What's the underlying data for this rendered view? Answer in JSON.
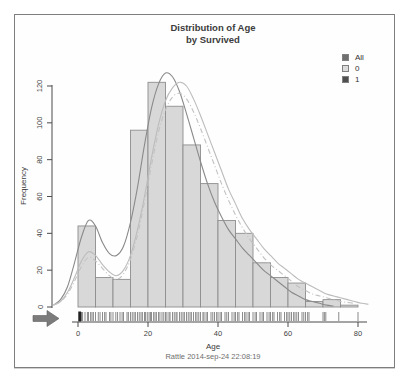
{
  "title": {
    "line1": "Distribution of Age",
    "line2": "by Survived"
  },
  "legend": {
    "items": [
      {
        "label": "All",
        "color": "#6f6f6f"
      },
      {
        "label": "0",
        "color": "#dcdcdc"
      },
      {
        "label": "1",
        "color": "#4f4f4f"
      }
    ]
  },
  "footer": "Rattle 2014-sep-24 22:08:19",
  "chart_data": {
    "type": "bar",
    "subtype": "histogram-with-density-and-rug",
    "title": "Distribution of Age by Survived",
    "xlabel": "Age",
    "ylabel": "Frequency",
    "xlim": [
      -7.5,
      84
    ],
    "ylim": [
      0,
      128
    ],
    "x_ticks": [
      0,
      20,
      40,
      60,
      80
    ],
    "y_ticks": [
      0,
      20,
      40,
      60,
      80,
      100,
      120
    ],
    "grid": "off",
    "legend_position": "top-right",
    "bin_width": 5,
    "bin_start_ages": [
      0,
      5,
      10,
      15,
      20,
      25,
      30,
      35,
      40,
      45,
      50,
      55,
      60,
      65,
      70,
      75
    ],
    "bin_counts": [
      44,
      16,
      15,
      96,
      122,
      109,
      88,
      67,
      47,
      40,
      24,
      16,
      13,
      3,
      4,
      1
    ],
    "bar_fill": "#d8d8d8",
    "bar_stroke": "#8e8e8e",
    "series": [
      {
        "name": "All",
        "style": "solid",
        "color": "#8a8a8a",
        "points": [
          [
            -7,
            1
          ],
          [
            -5,
            4
          ],
          [
            -3,
            11
          ],
          [
            -1,
            24
          ],
          [
            1,
            38
          ],
          [
            3,
            47
          ],
          [
            5,
            44
          ],
          [
            7,
            35
          ],
          [
            9,
            29
          ],
          [
            11,
            28
          ],
          [
            13,
            33
          ],
          [
            15,
            46
          ],
          [
            17,
            65
          ],
          [
            19,
            88
          ],
          [
            21,
            108
          ],
          [
            23,
            121
          ],
          [
            25,
            127
          ],
          [
            27,
            125
          ],
          [
            29,
            117
          ],
          [
            31,
            105
          ],
          [
            33,
            92
          ],
          [
            35,
            79
          ],
          [
            37,
            67
          ],
          [
            39,
            57
          ],
          [
            41,
            49
          ],
          [
            43,
            42
          ],
          [
            45,
            37
          ],
          [
            47,
            32
          ],
          [
            49,
            28
          ],
          [
            51,
            24
          ],
          [
            53,
            20
          ],
          [
            55,
            17
          ],
          [
            57,
            14
          ],
          [
            59,
            11
          ],
          [
            61,
            8
          ],
          [
            63,
            6
          ],
          [
            65,
            4
          ],
          [
            67,
            3
          ],
          [
            69,
            2
          ],
          [
            71,
            1
          ],
          [
            73,
            0.5
          ]
        ]
      },
      {
        "name": "0",
        "style": "solid",
        "color": "#bcbcbc",
        "points": [
          [
            -7,
            1
          ],
          [
            -5,
            3
          ],
          [
            -3,
            8
          ],
          [
            -1,
            16
          ],
          [
            1,
            25
          ],
          [
            3,
            30
          ],
          [
            5,
            28
          ],
          [
            7,
            23
          ],
          [
            9,
            19
          ],
          [
            11,
            17
          ],
          [
            13,
            20
          ],
          [
            15,
            28
          ],
          [
            17,
            42
          ],
          [
            19,
            60
          ],
          [
            21,
            81
          ],
          [
            23,
            99
          ],
          [
            25,
            112
          ],
          [
            27,
            119
          ],
          [
            29,
            122
          ],
          [
            31,
            120
          ],
          [
            33,
            113
          ],
          [
            35,
            104
          ],
          [
            37,
            94
          ],
          [
            39,
            84
          ],
          [
            41,
            74
          ],
          [
            43,
            64
          ],
          [
            45,
            56
          ],
          [
            47,
            48
          ],
          [
            49,
            42
          ],
          [
            51,
            37
          ],
          [
            53,
            32
          ],
          [
            55,
            28
          ],
          [
            57,
            24
          ],
          [
            59,
            21
          ],
          [
            61,
            18
          ],
          [
            63,
            15
          ],
          [
            65,
            13
          ],
          [
            67,
            11
          ],
          [
            69,
            9
          ],
          [
            71,
            7
          ],
          [
            73,
            6
          ],
          [
            75,
            5
          ],
          [
            77,
            4
          ],
          [
            79,
            3
          ],
          [
            81,
            2
          ],
          [
            83,
            1.5
          ]
        ]
      },
      {
        "name": "1",
        "style": "dash-dot",
        "color": "#c2c2c2",
        "points": [
          [
            -7,
            1
          ],
          [
            -5,
            3
          ],
          [
            -3,
            7
          ],
          [
            -1,
            14
          ],
          [
            1,
            22
          ],
          [
            3,
            27
          ],
          [
            5,
            25
          ],
          [
            7,
            21
          ],
          [
            9,
            17
          ],
          [
            11,
            15
          ],
          [
            13,
            18
          ],
          [
            15,
            26
          ],
          [
            17,
            39
          ],
          [
            19,
            57
          ],
          [
            21,
            77
          ],
          [
            23,
            95
          ],
          [
            25,
            107
          ],
          [
            27,
            114
          ],
          [
            29,
            116
          ],
          [
            31,
            113
          ],
          [
            33,
            106
          ],
          [
            35,
            97
          ],
          [
            37,
            87
          ],
          [
            39,
            77
          ],
          [
            41,
            67
          ],
          [
            43,
            58
          ],
          [
            45,
            50
          ],
          [
            47,
            43
          ],
          [
            49,
            37
          ],
          [
            51,
            32
          ],
          [
            53,
            27
          ],
          [
            55,
            23
          ],
          [
            57,
            20
          ],
          [
            59,
            17
          ],
          [
            61,
            14
          ],
          [
            63,
            11
          ],
          [
            65,
            9
          ],
          [
            67,
            7
          ],
          [
            69,
            6
          ],
          [
            71,
            5
          ],
          [
            73,
            4
          ],
          [
            75,
            3
          ],
          [
            77,
            2.5
          ],
          [
            79,
            2
          ]
        ]
      }
    ],
    "rug_ages": [
      0.8,
      1,
      1.3,
      2,
      2.7,
      3,
      3.6,
      4,
      4.4,
      5,
      5.8,
      6.3,
      7,
      7.6,
      8,
      9,
      9.4,
      10,
      10.8,
      11.3,
      12,
      12.6,
      13,
      14,
      14.4,
      15,
      15.5,
      16,
      16.4,
      17,
      17.5,
      18,
      18.4,
      19,
      19.3,
      19.8,
      20.3,
      20.7,
      21,
      21.6,
      22,
      22.4,
      23,
      23.4,
      24,
      24.5,
      25,
      25.4,
      26,
      26.3,
      27,
      27.5,
      28,
      28.3,
      29,
      29.5,
      30,
      30.4,
      31,
      31.5,
      32,
      32.4,
      33,
      33.6,
      34,
      34.5,
      35,
      35.7,
      36,
      36.6,
      37,
      38,
      38.5,
      39,
      39.6,
      40,
      40.6,
      41,
      42,
      42.5,
      43,
      44,
      44.6,
      45,
      45.6,
      46,
      47,
      47.6,
      48,
      48.6,
      49,
      50,
      50.6,
      51,
      52,
      52.6,
      53,
      54,
      54.6,
      55,
      55.6,
      56,
      57,
      57.6,
      58,
      59,
      59.6,
      60,
      60.5,
      61,
      61.6,
      62,
      62.5,
      63,
      64,
      64.5,
      65,
      65.6,
      66,
      70,
      70.4,
      70.8,
      74.5,
      80
    ],
    "rug_emphasis_ages": [
      0.45
    ],
    "annotation_arrow": {
      "shape": "right-arrow",
      "color": "#7b7b7b",
      "position": "bottom-left"
    }
  }
}
